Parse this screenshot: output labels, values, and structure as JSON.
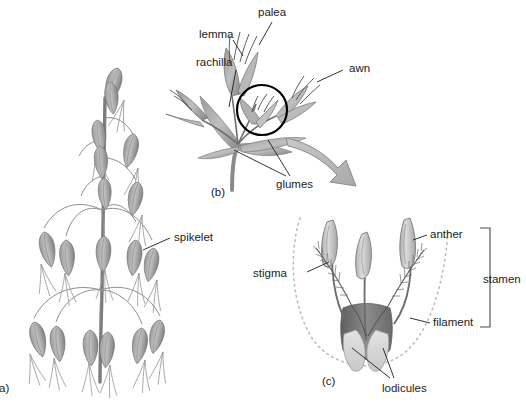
{
  "figure": {
    "background": "#ffffff"
  },
  "panels": [
    {
      "id": "a",
      "label": "a)",
      "caption": "oat panicle with spikelets"
    },
    {
      "id": "b",
      "label": "(b)",
      "caption": "spikelet detail with florets"
    },
    {
      "id": "c",
      "label": "(c)",
      "caption": "floret reproductive parts"
    }
  ],
  "labels": {
    "spikelet": "spikelet",
    "palea": "palea",
    "lemma": "lemma",
    "rachilla": "rachilla",
    "awn": "awn",
    "glumes": "glumes",
    "stigma": "stigma",
    "anther": "anther",
    "stamen": "stamen",
    "filament": "filament",
    "lodicules": "lodicules"
  },
  "colors": {
    "background": "#ffffff",
    "text": "#1c1c1c",
    "leader_line": "#1c1c1c",
    "spikelet_gray": "#8d8d8d",
    "spikelet_dark": "#7a7a7a",
    "leaf_gray": "#8f8f8f",
    "leaf_light": "#b5b5b5",
    "stem_gray": "#8a8a8a",
    "arrow_fill": "#bcbcbc",
    "arrow_stroke": "#8a8a8a",
    "anther_fill": "#c6c6c6",
    "anther_stroke": "#6f6f6f",
    "ovary_dark": "#6d6d6d",
    "lodicule_fill": "#d9d9d9",
    "dotted_outline": "#bdbdbd",
    "circle_highlight": "#000000",
    "bracket": "#4a4a4a"
  }
}
